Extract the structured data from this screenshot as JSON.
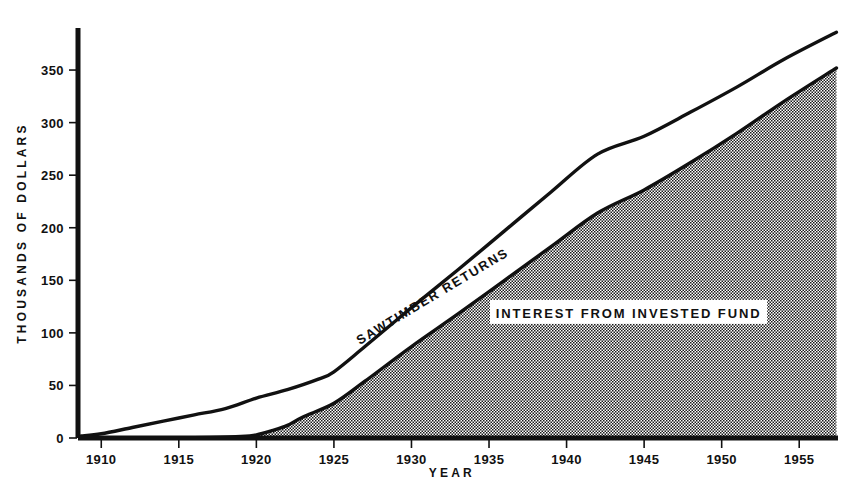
{
  "chart_data": {
    "type": "area",
    "title": "",
    "xlabel": "YEAR",
    "ylabel": "THOUSANDS OF DOLLARS",
    "xlim": [
      1908.5,
      1957.5
    ],
    "ylim": [
      0,
      390
    ],
    "grid": false,
    "legend_position": "inline-annotations",
    "x_ticks": [
      1910,
      1915,
      1920,
      1925,
      1930,
      1935,
      1940,
      1945,
      1950,
      1955
    ],
    "x_tick_labels": [
      "1910",
      "1915",
      "1920",
      "1925",
      "1930",
      "1935",
      "1940",
      "1945",
      "1950",
      "1955"
    ],
    "y_ticks": [
      0,
      50,
      100,
      150,
      200,
      250,
      300,
      350
    ],
    "y_tick_labels": [
      "0",
      "50",
      "100",
      "150",
      "200",
      "250",
      "300",
      "350"
    ],
    "annotations": [
      {
        "text": "SAWTIMBER RETURNS",
        "x": 1931.5,
        "y": 135,
        "rotation": -31
      },
      {
        "text": "INTEREST FROM INVESTED FUND",
        "x": 1944.0,
        "y": 118,
        "rotation": 0,
        "boxed": true
      }
    ],
    "series": [
      {
        "name": "SAWTIMBER RETURNS",
        "style": "line",
        "color": "#111111",
        "x": [
          1908.7,
          1910,
          1912,
          1914,
          1916,
          1918,
          1920,
          1922,
          1924,
          1925,
          1927,
          1930,
          1933,
          1936,
          1939,
          1942,
          1945,
          1948,
          1951,
          1954,
          1957.4
        ],
        "values": [
          2,
          4,
          10,
          16,
          22,
          28,
          38,
          46,
          56,
          63,
          87,
          124,
          160,
          197,
          234,
          270,
          287,
          310,
          334,
          360,
          386
        ]
      },
      {
        "name": "INTEREST FROM INVESTED FUND",
        "style": "area",
        "color": "#8c8c8c",
        "fill_pattern": "stipple",
        "x": [
          1908.7,
          1912,
          1915,
          1917,
          1919,
          1920,
          1921,
          1922,
          1923,
          1925,
          1927,
          1930,
          1933,
          1936,
          1939,
          1942,
          1945,
          1948,
          1951,
          1954,
          1957.4
        ],
        "values": [
          0,
          0,
          0,
          0.5,
          1.5,
          3,
          7,
          12,
          20,
          33,
          54,
          87,
          118,
          150,
          182,
          214,
          236,
          262,
          290,
          320,
          352
        ]
      }
    ]
  },
  "axes": {
    "y_axis_title": "THOUSANDS OF DOLLARS",
    "x_axis_title": "YEAR"
  }
}
